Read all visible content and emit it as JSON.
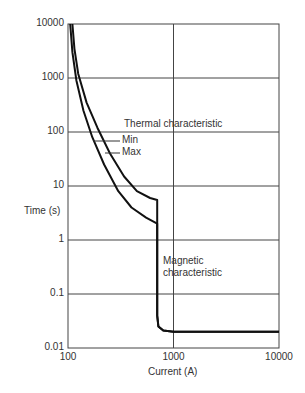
{
  "chart_data": {
    "type": "line",
    "title": "",
    "xlabel": "Current (A)",
    "ylabel": "Time (s)",
    "xscale": "log",
    "yscale": "log",
    "xlim": [
      100,
      10000
    ],
    "ylim": [
      0.01,
      10000
    ],
    "x_ticks": [
      "100",
      "1000",
      "10000"
    ],
    "y_ticks": [
      "10000",
      "1000",
      "100",
      "10",
      "1",
      "0.1",
      "0.01"
    ],
    "grid": true,
    "annotations": [
      {
        "text": "Thermal characteristic"
      },
      {
        "text": "Min"
      },
      {
        "text": "Max"
      },
      {
        "text": "Magnetic characteristic"
      }
    ],
    "series": [
      {
        "name": "Min",
        "x": [
          105,
          110,
          120,
          140,
          170,
          220,
          300,
          400,
          550,
          700,
          700,
          720,
          800,
          1000,
          10000
        ],
        "y": [
          10000,
          3000,
          900,
          250,
          80,
          25,
          8,
          4,
          2.6,
          2,
          0.04,
          0.025,
          0.021,
          0.02,
          0.02
        ]
      },
      {
        "name": "Max",
        "x": [
          110,
          115,
          125,
          150,
          190,
          250,
          340,
          450,
          600,
          700,
          700,
          720,
          800,
          1000,
          10000
        ],
        "y": [
          10000,
          3500,
          1200,
          350,
          120,
          40,
          15,
          8,
          6,
          5.5,
          0.04,
          0.025,
          0.021,
          0.02,
          0.02
        ]
      }
    ]
  },
  "labels": {
    "y_axis": "Time (s)",
    "x_axis": "Current (A)",
    "thermal": "Thermal characteristic",
    "min": "Min",
    "max": "Max",
    "magnetic_1": "Magnetic",
    "magnetic_2": "characteristic",
    "yticks": [
      "10000",
      "1000",
      "100",
      "10",
      "1",
      "0.1",
      "0.01"
    ],
    "xticks": [
      "100",
      "1000",
      "10000"
    ]
  }
}
